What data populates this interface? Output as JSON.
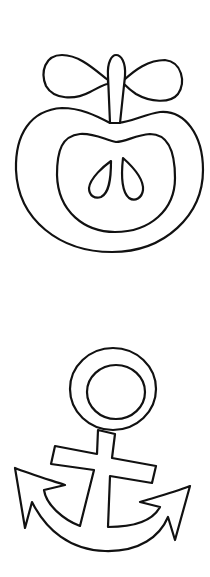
{
  "page": {
    "background": "#ffffff",
    "stroke_color": "#111111"
  },
  "drawings": [
    {
      "name": "apple",
      "style": "outline"
    },
    {
      "name": "anchor",
      "style": "outline"
    }
  ]
}
